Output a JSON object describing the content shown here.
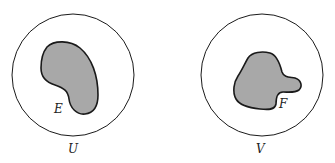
{
  "diagram": {
    "colors": {
      "stroke": "#1a1a1a",
      "fill_region": "#a8a8a8",
      "background": "#ffffff"
    },
    "left": {
      "circle_label": "U",
      "region_label": "E"
    },
    "right": {
      "circle_label": "V",
      "region_label": "F"
    }
  }
}
